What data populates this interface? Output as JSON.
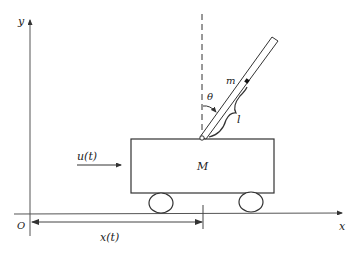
{
  "diagram": {
    "axes": {
      "x_label": "x",
      "y_label": "y",
      "origin_label": "O"
    },
    "labels": {
      "cart_mass": "M",
      "pendulum_mass": "m",
      "angle": "θ",
      "length": "l",
      "force": "u(t)",
      "position": "x(t)"
    },
    "colors": {
      "stroke": "#333333",
      "background": "#ffffff"
    }
  }
}
